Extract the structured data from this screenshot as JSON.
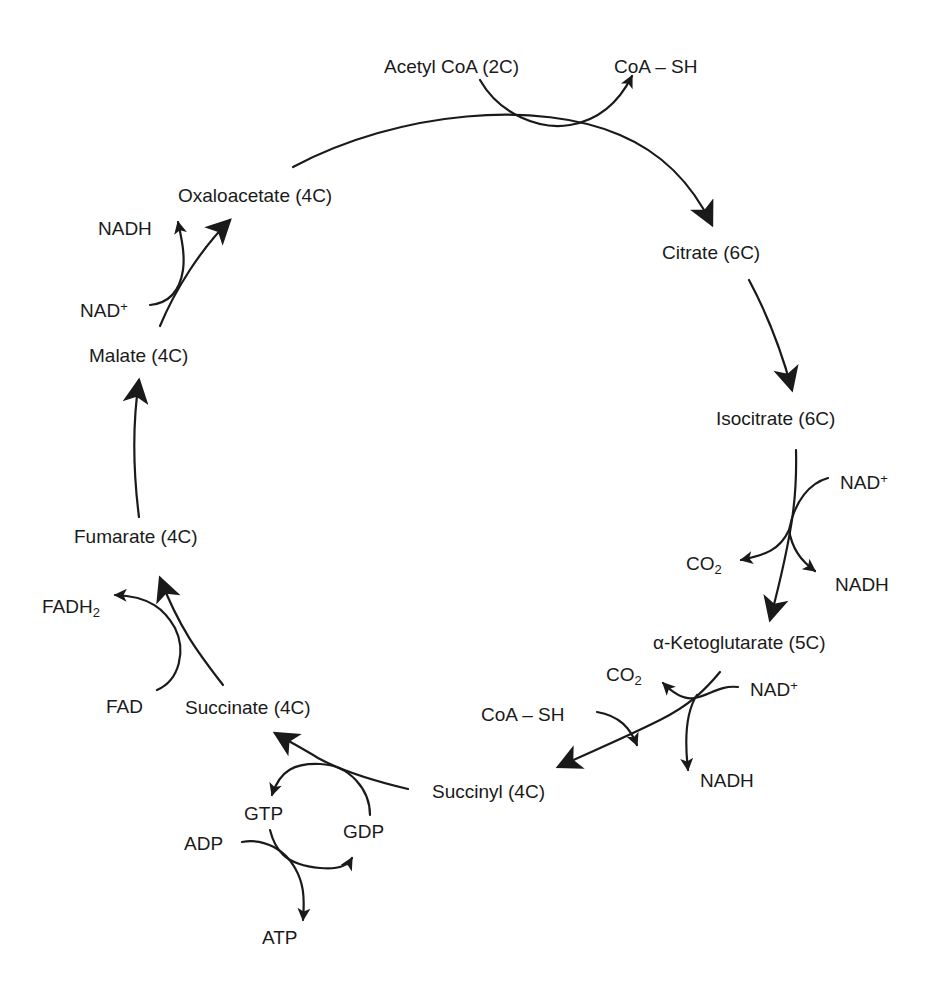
{
  "diagram": {
    "colors": {
      "ink": "#1a1a1a",
      "background": "#ffffff"
    },
    "nodes": {
      "acetyl_coa": "Acetyl CoA (2C)",
      "coa_sh_top": "CoA – SH",
      "oxaloacetate": "Oxaloacetate (4C)",
      "citrate": "Citrate (6C)",
      "isocitrate": "Isocitrate (6C)",
      "alpha_ketoglutarate": "α-Ketoglutarate (5C)",
      "succinyl": "Succinyl (4C)",
      "succinate": "Succinate (4C)",
      "fumarate": "Fumarate (4C)",
      "malate": "Malate (4C)"
    },
    "cofactors": {
      "malate_nad": "NAD",
      "malate_nad_sup": "+",
      "malate_nadh": "NADH",
      "iso_nad": "NAD",
      "iso_nad_sup": "+",
      "iso_co2": "CO",
      "iso_co2_sub": "2",
      "iso_nadh": "NADH",
      "akg_co2": "CO",
      "akg_co2_sub": "2",
      "akg_nad": "NAD",
      "akg_nad_sup": "+",
      "akg_nadh": "NADH",
      "akg_coa_sh": "CoA – SH",
      "gtp": "GTP",
      "gdp": "GDP",
      "adp": "ADP",
      "atp": "ATP",
      "fad": "FAD",
      "fadh2": "FADH",
      "fadh2_sub": "2"
    },
    "steps": [
      {
        "from": "Oxaloacetate (4C)",
        "to": "Citrate (6C)",
        "inputs": [
          "Acetyl CoA (2C)"
        ],
        "outputs": [
          "CoA – SH"
        ]
      },
      {
        "from": "Citrate (6C)",
        "to": "Isocitrate (6C)",
        "inputs": [],
        "outputs": []
      },
      {
        "from": "Isocitrate (6C)",
        "to": "α-Ketoglutarate (5C)",
        "inputs": [
          "NAD+"
        ],
        "outputs": [
          "CO2",
          "NADH"
        ]
      },
      {
        "from": "α-Ketoglutarate (5C)",
        "to": "Succinyl (4C)",
        "inputs": [
          "NAD+",
          "CoA – SH"
        ],
        "outputs": [
          "CO2",
          "NADH"
        ]
      },
      {
        "from": "Succinyl (4C)",
        "to": "Succinate (4C)",
        "inputs": [
          "GDP"
        ],
        "outputs": [
          "GTP"
        ]
      },
      {
        "from": "GTP",
        "to": "GDP",
        "inputs": [
          "ADP"
        ],
        "outputs": [
          "ATP"
        ]
      },
      {
        "from": "Succinate (4C)",
        "to": "Fumarate (4C)",
        "inputs": [
          "FAD"
        ],
        "outputs": [
          "FADH2"
        ]
      },
      {
        "from": "Fumarate (4C)",
        "to": "Malate (4C)",
        "inputs": [],
        "outputs": []
      },
      {
        "from": "Malate (4C)",
        "to": "Oxaloacetate (4C)",
        "inputs": [
          "NAD+"
        ],
        "outputs": [
          "NADH"
        ]
      }
    ]
  }
}
